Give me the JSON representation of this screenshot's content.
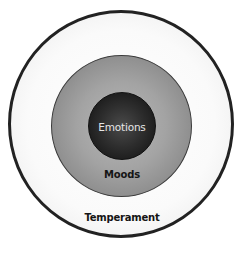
{
  "diagram": {
    "type": "concentric-circles",
    "layers": [
      {
        "id": "outer",
        "label": "Temperament",
        "fill": "#f5f5f5",
        "border": "#222222",
        "text_color": "#151515"
      },
      {
        "id": "middle",
        "label": "Moods",
        "fill": "#9a9a9a",
        "border": "#3a3a3a",
        "text_color": "#151515"
      },
      {
        "id": "inner",
        "label": "Emotions",
        "fill": "#2a2a2a",
        "border": "#111111",
        "text_color": "#e6e6e6"
      }
    ]
  }
}
